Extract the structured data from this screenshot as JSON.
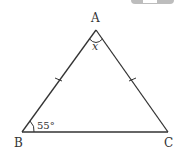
{
  "diagram": {
    "type": "isosceles-triangle",
    "vertices": {
      "A": {
        "label": "A",
        "x": 96,
        "y": 30
      },
      "B": {
        "label": "B",
        "x": 22,
        "y": 132
      },
      "C": {
        "label": "C",
        "x": 168,
        "y": 132
      }
    },
    "angle_A_label": "x",
    "angle_B_label": "55°",
    "equal_sides": [
      "AB",
      "AC"
    ],
    "colors": {
      "stroke": "#333333",
      "tab": "#bdbdbd"
    }
  }
}
